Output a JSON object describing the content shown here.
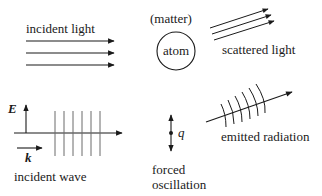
{
  "panels": {
    "incident_light": {
      "label": "incident light",
      "arrow_count": 3
    },
    "matter": {
      "label": "(matter)",
      "atom_label": "atom"
    },
    "scattered_light": {
      "label": "scattered light",
      "arrow_count": 3
    },
    "incident_wave": {
      "label": "incident wave",
      "field_label": "E",
      "wavevector_label": "k",
      "wavefront_count": 6
    },
    "forced_oscillation": {
      "charge_label": "q",
      "label_line1": "forced",
      "label_line2": "oscillation"
    },
    "emitted_radiation": {
      "label": "emitted radiation",
      "wavefront_count": 6
    }
  },
  "colors": {
    "ink": "#1a1a1a",
    "wavefront": "#6a6a6a",
    "background": "#ffffff"
  }
}
